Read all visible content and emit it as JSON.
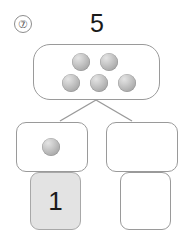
{
  "worksheet": {
    "problem_number": "⑦",
    "total": "5",
    "whole_group": {
      "counter_count": 5,
      "counters": [
        {
          "x": 72,
          "y": 53
        },
        {
          "x": 100,
          "y": 53
        },
        {
          "x": 62,
          "y": 74
        },
        {
          "x": 90,
          "y": 74
        },
        {
          "x": 118,
          "y": 74
        }
      ]
    },
    "part_left": {
      "counter_count": 1,
      "counters": [
        {
          "x": 42,
          "y": 138
        }
      ]
    },
    "part_right": {
      "counter_count": 0,
      "counters": []
    },
    "answer_left": {
      "value": "1",
      "filled": true,
      "fill_color": "#e3e3e3"
    },
    "answer_right": {
      "value": "",
      "filled": false,
      "fill_color": "#ffffff"
    },
    "colors": {
      "outline": "#9a9a9a",
      "counter_light": "#e4e4e4",
      "counter_dark": "#9a9a9a",
      "text": "#1a1a1a",
      "shaded_box": "#e3e3e3",
      "background": "#ffffff"
    },
    "connector": {
      "apex_x": 96,
      "apex_y": 100,
      "left_end_x": 60,
      "left_end_y": 121,
      "right_end_x": 132,
      "right_end_y": 121
    }
  }
}
